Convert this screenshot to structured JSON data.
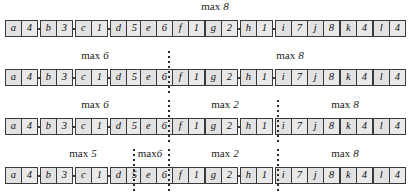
{
  "figure": {
    "node_count": 12,
    "row_count": 4,
    "label_word": "max"
  },
  "nodes": [
    {
      "key": "a",
      "value": "4"
    },
    {
      "key": "b",
      "value": "3"
    },
    {
      "key": "c",
      "value": "1"
    },
    {
      "key": "d",
      "value": "5"
    },
    {
      "key": "e",
      "value": "6"
    },
    {
      "key": "f",
      "value": "1"
    },
    {
      "key": "g",
      "value": "2"
    },
    {
      "key": "h",
      "value": "1"
    },
    {
      "key": "i",
      "value": "7"
    },
    {
      "key": "j",
      "value": "8"
    },
    {
      "key": "k",
      "value": "4"
    },
    {
      "key": "l",
      "value": "4"
    }
  ],
  "rows": [
    {
      "name": "row-1",
      "dividers": [],
      "labels": [
        {
          "word": "max",
          "num": "8",
          "center": 215,
          "tight": false
        }
      ]
    },
    {
      "name": "row-2",
      "dividers": [
        168
      ],
      "labels": [
        {
          "word": "max",
          "num": "6",
          "center": 95,
          "tight": false
        },
        {
          "word": "max",
          "num": "8",
          "center": 290,
          "tight": false
        }
      ]
    },
    {
      "name": "row-3",
      "dividers": [
        168,
        277
      ],
      "labels": [
        {
          "word": "max",
          "num": "6",
          "center": 95,
          "tight": false
        },
        {
          "word": "max",
          "num": "2",
          "center": 225,
          "tight": false
        },
        {
          "word": "max",
          "num": "8",
          "center": 345,
          "tight": false
        }
      ]
    },
    {
      "name": "row-4",
      "dividers": [
        133,
        168,
        277
      ],
      "labels": [
        {
          "word": "max",
          "num": "5",
          "center": 83,
          "tight": false
        },
        {
          "word": "max",
          "num": "6",
          "center": 150,
          "tight": true
        },
        {
          "word": "max",
          "num": "2",
          "center": 225,
          "tight": false
        },
        {
          "word": "max",
          "num": "8",
          "center": 345,
          "tight": false
        }
      ]
    }
  ],
  "geometry": {
    "node_xs": [
      5,
      40,
      75,
      110,
      140,
      172,
      205,
      240,
      275,
      307,
      340,
      373
    ],
    "node_width": 33,
    "row_tops": [
      0,
      49,
      98,
      147
    ]
  }
}
